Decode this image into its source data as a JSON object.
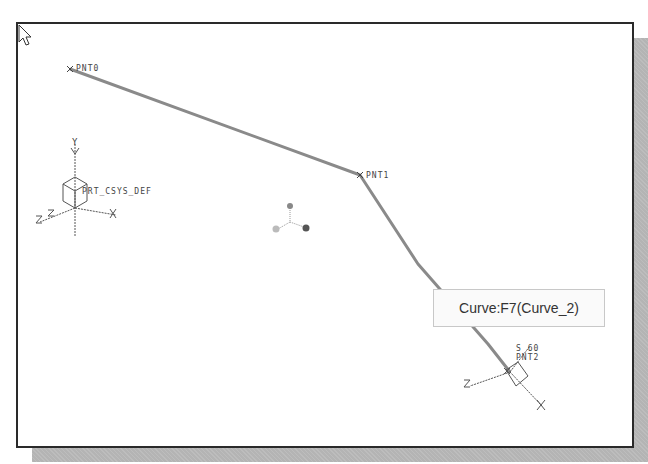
{
  "viewport": {
    "points": [
      {
        "id": "pnt0",
        "label": "PNT0"
      },
      {
        "id": "pnt1",
        "label": "PNT1"
      },
      {
        "id": "pnt2",
        "label": "PNT2"
      }
    ],
    "default_csys_label": "PRT_CSYS_DEF",
    "cs_label_near_pnt2": "S 60",
    "axis_labels": {
      "x": "X",
      "y": "Y",
      "z": "Z"
    },
    "curve_color": "#8a8a8a"
  },
  "tooltip": {
    "text": "Curve:F7(Curve_2)"
  }
}
